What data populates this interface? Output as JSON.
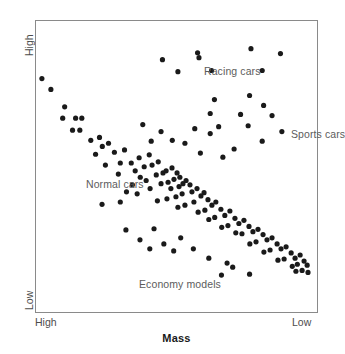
{
  "chart": {
    "type": "scatter",
    "title": "",
    "xlabel": "Mass",
    "ylabel": "Horsepower",
    "x_axis_left_label": "High",
    "x_axis_right_label": "Low",
    "y_axis_top_label": "High",
    "y_axis_bottom_label": "Low",
    "grid": false,
    "legend_position": "in-plot annotations",
    "annotations": [
      {
        "text": "Racing cars",
        "x_pct": 47.0,
        "y_pct": 8.2
      },
      {
        "text": "Sports cars",
        "x_pct": 77.7,
        "y_pct": 29.7
      },
      {
        "text": "Normal cars",
        "x_pct": 5.3,
        "y_pct": 46.8
      },
      {
        "text": "Economy models",
        "x_pct": 24.0,
        "y_pct": 81.0
      }
    ]
  },
  "chart_data": {
    "type": "scatter",
    "title": "",
    "xlabel": "Mass",
    "ylabel": "Horsepower",
    "xlim": [
      "High",
      "Low"
    ],
    "ylim": [
      "Low",
      "High"
    ],
    "x_tick_labels": [
      "High",
      "Low"
    ],
    "y_tick_labels": [
      "Low",
      "High"
    ],
    "grid": false,
    "axis_note": "Both axes are qualitative and reversed: Mass decreases left-to-right, Horsepower increases bottom-to-top.",
    "series": [
      {
        "name": "Normal cars",
        "color": "#1a1a1a",
        "marker": "filled-circle",
        "description": "Main negatively-sloped band running from upper-left (high mass, high horsepower) to lower-right (low mass, low horsepower).",
        "points": [
          [
            2.1,
            19.8
          ],
          [
            5.3,
            23.5
          ],
          [
            10.2,
            29.5
          ],
          [
            9.5,
            33.4
          ],
          [
            14.1,
            33.4
          ],
          [
            16.3,
            33.4
          ],
          [
            13.0,
            37.5
          ],
          [
            15.6,
            37.5
          ],
          [
            19.5,
            41.0
          ],
          [
            22.6,
            40.0
          ],
          [
            23.6,
            43.1
          ],
          [
            25.8,
            42.0
          ],
          [
            21.2,
            45.8
          ],
          [
            27.9,
            45.1
          ],
          [
            31.5,
            44.3
          ],
          [
            24.7,
            49.5
          ],
          [
            30.0,
            48.8
          ],
          [
            33.9,
            48.8
          ],
          [
            36.7,
            47.0
          ],
          [
            29.3,
            52.6
          ],
          [
            35.3,
            51.5
          ],
          [
            40.3,
            46.0
          ],
          [
            38.5,
            50.1
          ],
          [
            41.3,
            49.5
          ],
          [
            43.5,
            48.4
          ],
          [
            37.1,
            53.7
          ],
          [
            34.3,
            56.3
          ],
          [
            39.2,
            54.8
          ],
          [
            42.8,
            52.9
          ],
          [
            45.2,
            52.2
          ],
          [
            32.2,
            58.7
          ],
          [
            36.0,
            59.4
          ],
          [
            40.6,
            57.6
          ],
          [
            44.5,
            55.9
          ],
          [
            47.0,
            55.4
          ],
          [
            46.3,
            51.5
          ],
          [
            48.4,
            50.5
          ],
          [
            50.2,
            52.2
          ],
          [
            49.1,
            54.4
          ],
          [
            51.2,
            53.7
          ],
          [
            48.0,
            57.6
          ],
          [
            50.9,
            56.9
          ],
          [
            52.3,
            55.9
          ],
          [
            53.4,
            54.8
          ],
          [
            54.8,
            56.3
          ],
          [
            52.0,
            59.4
          ],
          [
            49.8,
            60.4
          ],
          [
            46.6,
            61.1
          ],
          [
            43.2,
            61.8
          ],
          [
            55.5,
            58.7
          ],
          [
            57.3,
            57.6
          ],
          [
            58.7,
            60.1
          ],
          [
            56.2,
            62.2
          ],
          [
            53.0,
            63.3
          ],
          [
            50.5,
            64.0
          ],
          [
            59.8,
            59.0
          ],
          [
            61.2,
            61.4
          ],
          [
            62.6,
            63.3
          ],
          [
            60.1,
            65.0
          ],
          [
            57.7,
            65.7
          ],
          [
            64.0,
            62.2
          ],
          [
            65.8,
            64.7
          ],
          [
            67.2,
            66.8
          ],
          [
            63.6,
            67.5
          ],
          [
            61.5,
            68.2
          ],
          [
            69.0,
            65.3
          ],
          [
            70.8,
            67.8
          ],
          [
            72.2,
            69.6
          ],
          [
            68.3,
            70.3
          ],
          [
            66.1,
            70.9
          ],
          [
            74.0,
            68.5
          ],
          [
            75.8,
            70.6
          ],
          [
            77.2,
            72.4
          ],
          [
            73.3,
            73.1
          ],
          [
            71.1,
            72.8
          ],
          [
            79.0,
            71.6
          ],
          [
            80.8,
            73.4
          ],
          [
            82.2,
            75.2
          ],
          [
            78.3,
            75.9
          ],
          [
            76.1,
            76.6
          ],
          [
            84.0,
            74.5
          ],
          [
            85.8,
            76.6
          ],
          [
            87.2,
            78.3
          ],
          [
            83.3,
            78.7
          ],
          [
            81.1,
            79.4
          ],
          [
            89.0,
            77.6
          ],
          [
            90.8,
            79.7
          ],
          [
            92.2,
            81.5
          ],
          [
            88.3,
            81.8
          ],
          [
            86.1,
            82.2
          ],
          [
            94.0,
            80.4
          ],
          [
            95.4,
            82.5
          ],
          [
            93.0,
            83.6
          ],
          [
            91.2,
            84.3
          ],
          [
            96.5,
            83.9
          ],
          [
            94.7,
            85.7
          ],
          [
            92.5,
            86.0
          ],
          [
            96.8,
            86.4
          ]
        ]
      },
      {
        "name": "Racing cars",
        "color": "#1a1a1a",
        "marker": "filled-circle",
        "description": "Upper-right scatter cluster: high horsepower across low-to-moderate mass.",
        "points": [
          [
            45.0,
            13.3
          ],
          [
            57.5,
            10.9
          ],
          [
            76.5,
            9.5
          ],
          [
            87.0,
            11.2
          ],
          [
            50.5,
            17.4
          ],
          [
            62.5,
            17.0
          ],
          [
            80.5,
            17.0
          ],
          [
            58.0,
            12.6
          ]
        ]
      },
      {
        "name": "Sports cars",
        "color": "#1a1a1a",
        "marker": "filled-circle",
        "description": "Right-middle cluster: moderate-to-high horsepower at low mass.",
        "points": [
          [
            63.5,
            27.0
          ],
          [
            76.0,
            25.6
          ],
          [
            81.0,
            29.0
          ],
          [
            62.0,
            31.8
          ],
          [
            72.8,
            32.1
          ],
          [
            84.0,
            32.5
          ],
          [
            38.0,
            35.6
          ],
          [
            65.0,
            36.3
          ],
          [
            75.5,
            36.0
          ],
          [
            56.5,
            37.0
          ],
          [
            62.0,
            38.7
          ],
          [
            44.5,
            38.0
          ],
          [
            41.0,
            41.3
          ],
          [
            48.5,
            41.0
          ],
          [
            53.0,
            42.0
          ],
          [
            80.5,
            41.3
          ],
          [
            70.5,
            44.0
          ],
          [
            58.5,
            45.4
          ],
          [
            66.5,
            46.8
          ],
          [
            87.5,
            38.0
          ]
        ]
      },
      {
        "name": "Economy models",
        "color": "#1a1a1a",
        "marker": "filled-circle",
        "description": "Lower-left / lower-middle outlier scatter: low horsepower at moderate mass.",
        "points": [
          [
            23.5,
            63.0
          ],
          [
            30.0,
            62.2
          ],
          [
            32.0,
            71.8
          ],
          [
            42.0,
            71.4
          ],
          [
            37.0,
            75.2
          ],
          [
            45.5,
            76.6
          ],
          [
            51.5,
            74.5
          ],
          [
            40.5,
            78.3
          ],
          [
            49.0,
            79.0
          ],
          [
            56.0,
            78.3
          ],
          [
            61.5,
            81.5
          ],
          [
            68.0,
            83.2
          ],
          [
            66.0,
            87.3
          ],
          [
            76.0,
            87.0
          ],
          [
            70.0,
            84.6
          ]
        ]
      }
    ]
  }
}
